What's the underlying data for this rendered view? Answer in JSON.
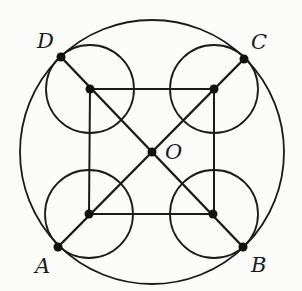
{
  "diagram": {
    "type": "geometry",
    "colors": {
      "stroke": "#1a1a1a",
      "background": "#fbfbf9"
    },
    "big_circle": {
      "cx": 152,
      "cy": 152,
      "r": 132
    },
    "inner_square": [
      [
        90,
        89
      ],
      [
        214,
        89
      ],
      [
        214,
        214
      ],
      [
        89,
        214
      ]
    ],
    "small_circles": [
      {
        "cx": 90,
        "cy": 89,
        "r": 44
      },
      {
        "cx": 214,
        "cy": 89,
        "r": 44
      },
      {
        "cx": 214,
        "cy": 214,
        "r": 44
      },
      {
        "cx": 89,
        "cy": 214,
        "r": 44
      }
    ],
    "points": {
      "A": {
        "label": "A",
        "x": 58,
        "y": 247
      },
      "B": {
        "label": "B",
        "x": 243,
        "y": 247
      },
      "C": {
        "label": "C",
        "x": 244,
        "y": 59
      },
      "D": {
        "label": "D",
        "x": 61,
        "y": 57
      },
      "O": {
        "label": "O",
        "x": 152,
        "y": 152
      }
    },
    "segments": [
      [
        "A",
        "C"
      ],
      [
        "D",
        "B"
      ]
    ]
  }
}
